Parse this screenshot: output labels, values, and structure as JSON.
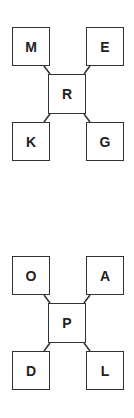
{
  "diagrams": [
    {
      "center": "R",
      "top_left": "M",
      "top_right": "E",
      "bottom_left": "K",
      "bottom_right": "G"
    },
    {
      "center": "P",
      "top_left": "O",
      "top_right": "A",
      "bottom_left": "D",
      "bottom_right": "L"
    }
  ]
}
